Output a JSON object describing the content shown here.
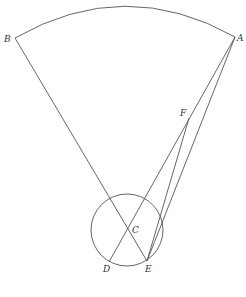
{
  "diagram": {
    "colors": {
      "line": "#555555",
      "label": "#333333",
      "background": "#ffffff"
    },
    "points": {
      "A": {
        "label": "A",
        "x": 235,
        "y": 37
      },
      "B": {
        "label": "B",
        "x": 15,
        "y": 38
      },
      "C": {
        "label": "C",
        "x": 128,
        "y": 229
      },
      "D": {
        "label": "D",
        "x": 109,
        "y": 262
      },
      "E": {
        "label": "E",
        "x": 147,
        "y": 261
      },
      "F": {
        "label": "F",
        "x": 189,
        "y": 118
      }
    },
    "circle": {
      "center": "C",
      "cx": 127,
      "cy": 230,
      "r": 36
    },
    "arc": {
      "from": "B",
      "to": "A",
      "peak_y": 6
    },
    "segments": [
      [
        "B",
        "E"
      ],
      [
        "A",
        "D"
      ],
      [
        "A",
        "E"
      ],
      [
        "F",
        "E"
      ]
    ]
  }
}
